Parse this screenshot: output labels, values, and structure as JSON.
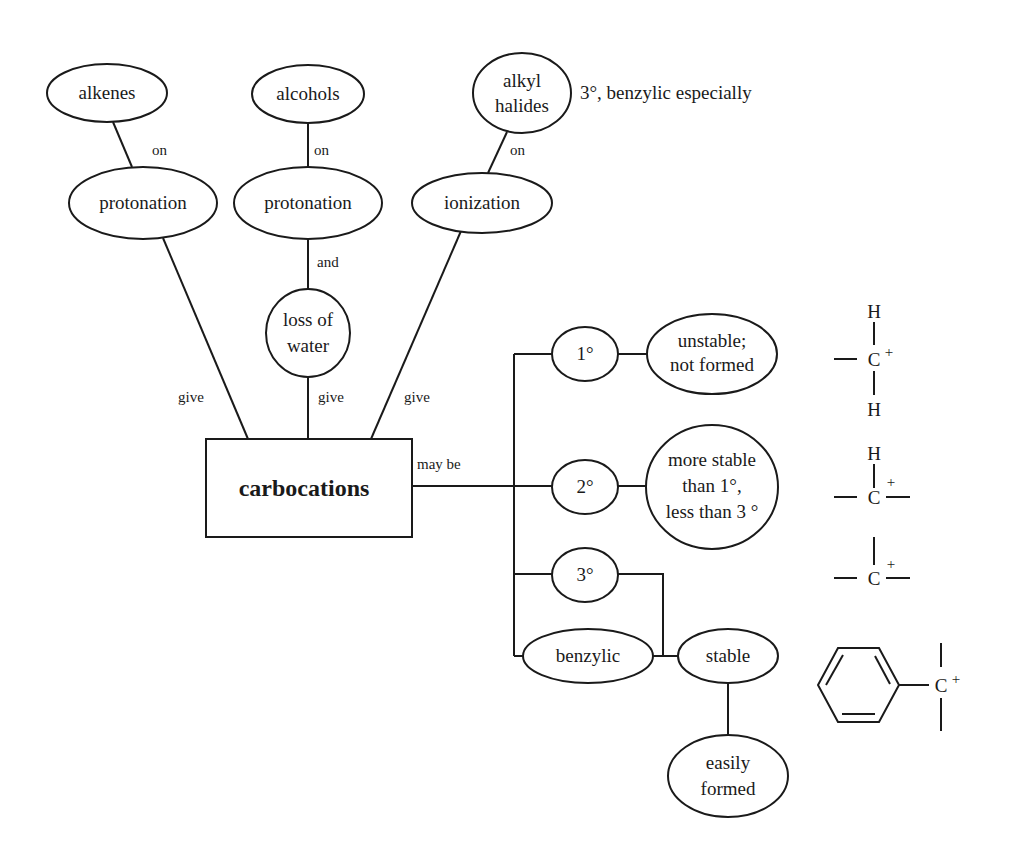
{
  "diagram": {
    "title": "carbocations",
    "colors": {
      "stroke": "#1a1a1a",
      "background": "#ffffff"
    },
    "nodes": {
      "alkenes": {
        "lines": [
          "alkenes"
        ]
      },
      "alcohols": {
        "lines": [
          "alcohols"
        ]
      },
      "alkyl_halides": {
        "lines": [
          "alkyl",
          "halides"
        ]
      },
      "protonation_1": {
        "lines": [
          "protonation"
        ]
      },
      "protonation_2": {
        "lines": [
          "protonation"
        ]
      },
      "ionization": {
        "lines": [
          "ionization"
        ]
      },
      "loss_of_water": {
        "lines": [
          "loss of",
          "water"
        ]
      },
      "carbocations": {
        "lines": [
          "carbocations"
        ]
      },
      "primary": {
        "lines": [
          "1°"
        ]
      },
      "secondary": {
        "lines": [
          "2°"
        ]
      },
      "tertiary": {
        "lines": [
          "3°"
        ]
      },
      "benzylic": {
        "lines": [
          "benzylic"
        ]
      },
      "unstable": {
        "lines": [
          "unstable;",
          "not formed"
        ]
      },
      "more_stable": {
        "lines": [
          "more stable",
          "than 1°,",
          "less than 3 °"
        ]
      },
      "stable": {
        "lines": [
          "stable"
        ]
      },
      "easily_formed": {
        "lines": [
          "easily",
          "formed"
        ]
      }
    },
    "edge_labels": {
      "alkenes_on": "on",
      "alcohols_on": "on",
      "alkyl_halides_on": "on",
      "and": "and",
      "give_left": "give",
      "give_middle": "give",
      "give_right": "give",
      "may_be": "may be"
    },
    "annotation": "3°, benzylic especially",
    "structures": {
      "primary": {
        "top": "H",
        "center": "C",
        "charge": "+",
        "bottom": "H"
      },
      "secondary": {
        "top": "H",
        "center": "C",
        "charge": "+"
      },
      "tertiary": {
        "center": "C",
        "charge": "+"
      },
      "benzylic": {
        "center": "C",
        "charge": "+"
      }
    }
  }
}
